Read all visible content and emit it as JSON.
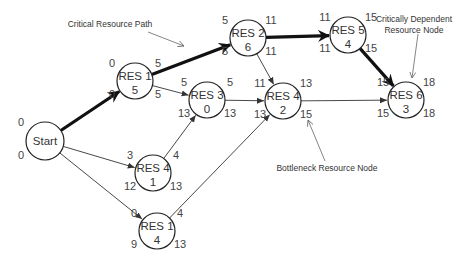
{
  "nodes": [
    {
      "id": "start",
      "label": "Start",
      "value": "",
      "x": 45,
      "y": 141,
      "r": 19,
      "tl": "0",
      "bl": "0",
      "tr": "",
      "br": ""
    },
    {
      "id": "res1_top",
      "label": "RES 1",
      "value": "5",
      "x": 135,
      "y": 81,
      "r": 18,
      "tl": "0",
      "bl": "0",
      "tr": "5",
      "br": "5"
    },
    {
      "id": "res2",
      "label": "RES 2",
      "value": "6",
      "x": 248,
      "y": 38,
      "r": 18,
      "tl": "5",
      "bl": "5",
      "tr": "11",
      "br": "11"
    },
    {
      "id": "res3",
      "label": "RES 3",
      "value": "0",
      "x": 207,
      "y": 100,
      "r": 18,
      "tl": "5",
      "bl": "13",
      "tr": "5",
      "br": "13"
    },
    {
      "id": "res4_mid",
      "label": "RES 4",
      "value": "2",
      "x": 283,
      "y": 101,
      "r": 18,
      "tl": "11",
      "bl": "13",
      "tr": "13",
      "br": "15"
    },
    {
      "id": "res5",
      "label": "RES 5",
      "value": "4",
      "x": 348,
      "y": 35,
      "r": 18,
      "tl": "11",
      "bl": "11",
      "tr": "15",
      "br": "15"
    },
    {
      "id": "res6",
      "label": "RES 6",
      "value": "3",
      "x": 406,
      "y": 100,
      "r": 18,
      "tl": "15",
      "bl": "15",
      "tr": "18",
      "br": "18"
    },
    {
      "id": "res4_low",
      "label": "RES 4",
      "value": "1",
      "x": 153,
      "y": 173,
      "r": 18,
      "tl": "3",
      "bl": "12",
      "tr": "4",
      "br": "13"
    },
    {
      "id": "res1_low",
      "label": "RES 1",
      "value": "4",
      "x": 157,
      "y": 231,
      "r": 18,
      "tl": "0",
      "bl": "9",
      "tr": "4",
      "br": "13"
    }
  ],
  "edges": [
    {
      "from": "start",
      "to": "res1_top",
      "critical": true
    },
    {
      "from": "res1_top",
      "to": "res2",
      "critical": true
    },
    {
      "from": "res2",
      "to": "res5",
      "critical": true
    },
    {
      "from": "res5",
      "to": "res6",
      "critical": true
    },
    {
      "from": "res1_top",
      "to": "res3",
      "critical": false
    },
    {
      "from": "res2",
      "to": "res4_mid",
      "critical": false
    },
    {
      "from": "res3",
      "to": "res4_mid",
      "critical": false
    },
    {
      "from": "res4_mid",
      "to": "res6",
      "critical": false
    },
    {
      "from": "start",
      "to": "res4_low",
      "critical": false
    },
    {
      "from": "start",
      "to": "res1_low",
      "critical": false
    },
    {
      "from": "res4_low",
      "to": "res3",
      "critical": false
    },
    {
      "from": "res1_low",
      "to": "res4_mid",
      "critical": false
    }
  ],
  "annotations": {
    "critical_path": {
      "lines": [
        "Critical Resource Path"
      ],
      "x": 110,
      "y": 27,
      "arrow": [
        148,
        32,
        184,
        46
      ]
    },
    "critically_dependent": {
      "lines": [
        "Critically Dependent",
        "Resource Node"
      ],
      "x": 414,
      "y": 22,
      "arrow": [
        418,
        34,
        412,
        78
      ]
    },
    "bottleneck": {
      "lines": [
        "Bottleneck Resource Node"
      ],
      "x": 327,
      "y": 171,
      "arrow": [
        325,
        161,
        308,
        120
      ]
    }
  },
  "colors": {
    "critical_edge": "#111111",
    "normal_edge": "#333333",
    "node_stroke": "#222222",
    "text": "#333333"
  }
}
